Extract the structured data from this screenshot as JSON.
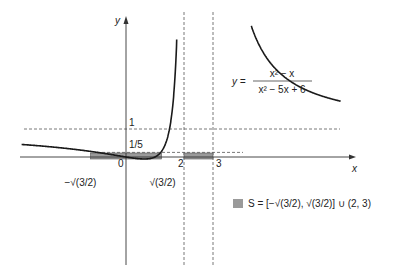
{
  "chart_data": {
    "type": "line",
    "title": "",
    "xlabel": "x",
    "ylabel": "y",
    "function_label": {
      "lhs": "y =",
      "numerator": "x² − x",
      "denominator": "x² − 5x + 6"
    },
    "xlim": [
      -4.2,
      7.5
    ],
    "ylim": [
      -3.8,
      5.5
    ],
    "vertical_asymptotes": [
      2,
      3
    ],
    "horizontal_asymptote": 1,
    "reference_line": 0.2,
    "x_tick_labels": [
      {
        "value": -1.2247,
        "label": "−√(3/2)"
      },
      {
        "value": 0,
        "label": "0"
      },
      {
        "value": 1.2247,
        "label": "√(3/2)"
      },
      {
        "value": 2,
        "label": "2"
      },
      {
        "value": 3,
        "label": "3"
      }
    ],
    "y_tick_labels": [
      {
        "value": 1,
        "label": "1"
      },
      {
        "value": 0.2,
        "label": "1/5"
      }
    ],
    "solution_intervals": [
      {
        "from": -1.2247,
        "to": 1.2247,
        "closed_left": true,
        "closed_right": true
      },
      {
        "from": 2,
        "to": 3,
        "closed_left": false,
        "closed_right": false
      }
    ],
    "legend": {
      "position": "bottom-right",
      "text": "S = [−√(3/2), √(3/2)] ∪ (2, 3)",
      "swatch_color": "#9a9a9a"
    },
    "series": [
      {
        "name": "y = (x² − x)/(x² − 5x + 6)",
        "domain": "x < 2"
      },
      {
        "name": "middle branch",
        "domain": "2 < x < 3"
      },
      {
        "name": "right branch",
        "domain": "x > 3"
      }
    ]
  }
}
